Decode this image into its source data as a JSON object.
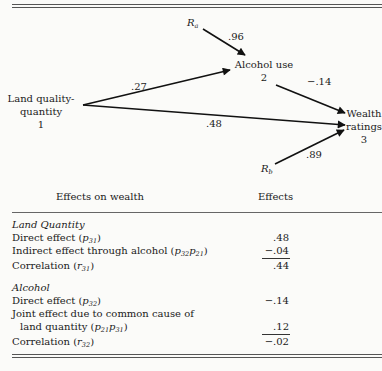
{
  "diagram": {
    "nodes": {
      "land": {
        "line1": "Land quality-",
        "line2": "quantity",
        "num": "1"
      },
      "alcohol": {
        "line1": "Alcohol use",
        "num": "2"
      },
      "wealth": {
        "line1": "Wealth",
        "line2": "ratings",
        "num": "3"
      },
      "ra": {
        "base": "R",
        "sub": "a"
      },
      "rb": {
        "base": "R",
        "sub": "b"
      }
    },
    "paths": {
      "p21": ".27",
      "p31": ".48",
      "p32": "−.14",
      "ra_to_2": ".96",
      "rb_to_3": ".89"
    }
  },
  "table": {
    "headers": {
      "left": "Effects on wealth",
      "right": "Effects"
    },
    "sections": [
      {
        "title": "Land Quantity",
        "rows": [
          {
            "label": "Direct effect (",
            "sym": "p",
            "sub": "31",
            "close": ")",
            "value": ".48"
          },
          {
            "label": "Indirect effect through alcohol (",
            "sym": "p",
            "sub": "32",
            "sym2": "p",
            "sub2": "21",
            "close": ")",
            "value": "−.04"
          },
          {
            "label": "Correlation (",
            "sym": "r",
            "sub": "31",
            "close": ")",
            "value": ".44"
          }
        ]
      },
      {
        "title": "Alcohol",
        "rows": [
          {
            "label": "Direct effect (",
            "sym": "p",
            "sub": "32",
            "close": ")",
            "value": "−.14"
          },
          {
            "label": "Joint effect due to common cause of",
            "value": ""
          },
          {
            "label": "land quantity (",
            "sym": "p",
            "sub": "21",
            "sym2": "p",
            "sub2": "31",
            "close": ")",
            "value": ".12"
          },
          {
            "label": "Correlation (",
            "sym": "r",
            "sub": "32",
            "close": ")",
            "value": "−.02"
          }
        ]
      }
    ]
  }
}
